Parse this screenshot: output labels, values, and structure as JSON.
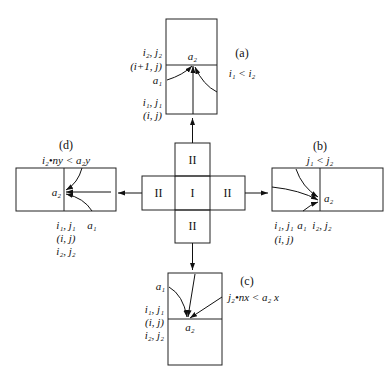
{
  "center": {
    "cell_center": "I",
    "cell_top": "II",
    "cell_left": "II",
    "cell_right": "II",
    "cell_bottom": "II"
  },
  "panel_a": {
    "tag": "(a)",
    "condition": "i₁ < i₂",
    "label_i2j2": "i₂, j₂",
    "label_i1j": "(i+1, j)",
    "label_a1": "a₁",
    "label_a2": "a₂",
    "label_i1j1": "i₁, j₁",
    "label_ij": "(i, j)"
  },
  "panel_b": {
    "tag": "(b)",
    "condition": "j₁ < j₂",
    "label_a2": "a₂",
    "label_i1j1": "i₁, j₁",
    "label_a1": "a₁",
    "label_i2j2": "i₂, j₂",
    "label_ij": "(i, j)"
  },
  "panel_c": {
    "tag": "(c)",
    "condition": "j₂•nx < a₂ x",
    "label_a1": "a₁",
    "label_a2": "a₂",
    "label_i1j1": "i₁, j₁",
    "label_ij": "(i, j)",
    "label_i2j2": "i₂, j₂"
  },
  "panel_d": {
    "tag": "(d)",
    "condition": "i₂•ny < a₂y",
    "label_a2": "a₂",
    "label_i1j1": "i₁, j₁",
    "label_a1": "a₁",
    "label_ij": "(i, j)",
    "label_i2j2": "i₂, j₂"
  }
}
